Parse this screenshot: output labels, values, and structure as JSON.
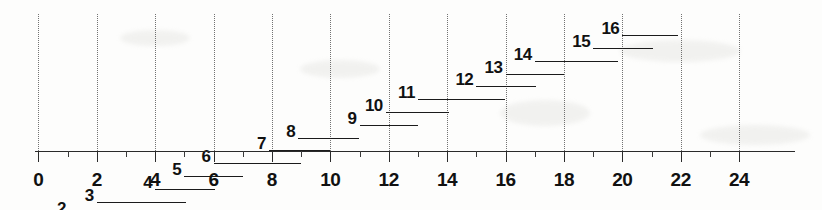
{
  "chart_data": {
    "type": "bar",
    "orientation": "horizontal",
    "title": "",
    "subtitle": "",
    "xlabel": "",
    "ylabel": "",
    "xlim": [
      -1.3,
      26.0
    ],
    "grid": true,
    "grid_axis": "x",
    "grid_style": "dotted",
    "grid_values": [
      0,
      2,
      4,
      6,
      8,
      10,
      12,
      14,
      16,
      18,
      20,
      22,
      24
    ],
    "legend": "none",
    "axis_tick_labels": [
      "0",
      "2",
      "4",
      "6",
      "8",
      "10",
      "12",
      "14",
      "16",
      "18",
      "20",
      "22",
      "24"
    ],
    "axis_tick_values": [
      0,
      2,
      4,
      6,
      8,
      10,
      12,
      14,
      16,
      18,
      20,
      22,
      24
    ],
    "minor_tick_values": [
      1,
      3,
      5,
      7,
      9,
      11,
      13,
      15,
      17,
      19,
      21,
      23
    ],
    "categories": [
      "1",
      "2",
      "3",
      "4",
      "5",
      "6",
      "7",
      "8",
      "9",
      "10",
      "11",
      "12",
      "13",
      "14",
      "15",
      "16"
    ],
    "intervals": [
      {
        "label": "1",
        "start": 0.0,
        "end": 2.0
      },
      {
        "label": "2",
        "start": 1.05,
        "end": 3.05
      },
      {
        "label": "3",
        "start": 2.0,
        "end": 5.05
      },
      {
        "label": "4",
        "start": 4.0,
        "end": 6.05
      },
      {
        "label": "5",
        "start": 5.0,
        "end": 7.0
      },
      {
        "label": "6",
        "start": 6.0,
        "end": 9.0
      },
      {
        "label": "7",
        "start": 7.9,
        "end": 10.0
      },
      {
        "label": "8",
        "start": 8.9,
        "end": 11.0
      },
      {
        "label": "9",
        "start": 11.0,
        "end": 13.0
      },
      {
        "label": "10",
        "start": 11.9,
        "end": 14.05
      },
      {
        "label": "11",
        "start": 13.0,
        "end": 16.0
      },
      {
        "label": "12",
        "start": 15.0,
        "end": 17.05
      },
      {
        "label": "13",
        "start": 16.0,
        "end": 18.0
      },
      {
        "label": "14",
        "start": 17.0,
        "end": 19.85
      },
      {
        "label": "15",
        "start": 19.0,
        "end": 21.05
      },
      {
        "label": "16",
        "start": 20.0,
        "end": 21.9
      }
    ]
  }
}
